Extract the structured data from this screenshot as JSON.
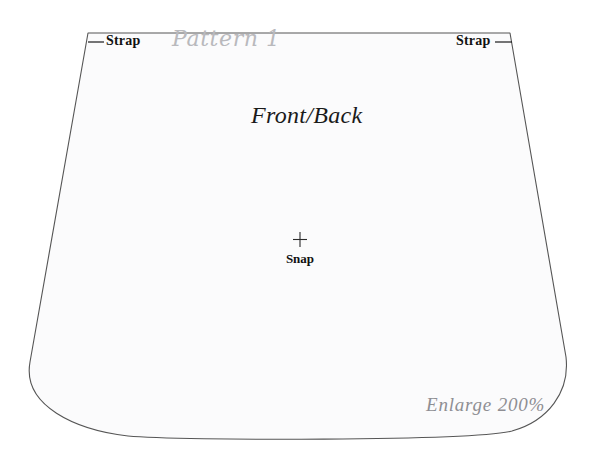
{
  "sheet": {
    "title": "Pattern 1",
    "background_color": "#ffffff",
    "piece_fill_color": "#fbfbfc",
    "outline_color": "#555555",
    "script_text_color": "#b9b9bd",
    "dark_text_color": "#111111",
    "gray_note_color": "#8e8e93"
  },
  "pattern_piece": {
    "name": "Front/Back",
    "shape": "trapezoid-with-rounded-bottom-corners"
  },
  "callouts": {
    "strap_left": {
      "label": "Strap",
      "leader_icon": "leader-line-icon"
    },
    "strap_right": {
      "label": "Strap",
      "leader_icon": "leader-line-icon"
    }
  },
  "markings": {
    "snap": {
      "label": "Snap",
      "marker_icon": "crosshair-plus-icon"
    }
  },
  "notes": {
    "enlarge": "Enlarge 200%"
  }
}
